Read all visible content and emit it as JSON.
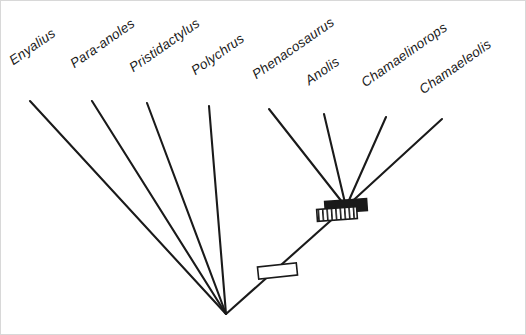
{
  "figure": {
    "type": "cladogram",
    "background_color": "#ffffff",
    "line_color": "#1a1a1a",
    "border_color": "#d8d8d8",
    "width": 526,
    "height": 335
  },
  "taxa": [
    {
      "name": "Enyalius",
      "label_x": 14,
      "label_y": 66,
      "tip_x": 29,
      "tip_y": 100
    },
    {
      "name": "Para-anoles",
      "label_x": 75,
      "label_y": 69,
      "tip_x": 91,
      "tip_y": 100
    },
    {
      "name": "Pristidactylus",
      "label_x": 134,
      "label_y": 73,
      "tip_x": 146,
      "tip_y": 102
    },
    {
      "name": "Polychrus",
      "label_x": 196,
      "label_y": 76,
      "tip_x": 208,
      "tip_y": 105
    },
    {
      "name": "Phenacosaurus",
      "label_x": 257,
      "label_y": 80,
      "tip_x": 268,
      "tip_y": 108
    },
    {
      "name": "Anolis",
      "label_x": 310,
      "label_y": 86,
      "tip_x": 323,
      "tip_y": 113
    },
    {
      "name": "Chamaelinorops",
      "label_x": 366,
      "label_y": 88,
      "tip_x": 385,
      "tip_y": 116
    },
    {
      "name": "Chamaeleolis",
      "label_x": 424,
      "label_y": 95,
      "tip_x": 441,
      "tip_y": 118
    }
  ],
  "nodes": {
    "root": {
      "name": "basal-node",
      "x": 225,
      "y": 313
    },
    "anoline_crown": {
      "name": "anoline-crown-node",
      "x": 345,
      "y": 206
    }
  },
  "branches": [
    {
      "name": "branch-enyalius",
      "from": "tip",
      "x1": 29,
      "y1": 100,
      "x2": 225,
      "y2": 313
    },
    {
      "name": "branch-para-anoles",
      "from": "tip",
      "x1": 91,
      "y1": 100,
      "x2": 225,
      "y2": 313
    },
    {
      "name": "branch-pristidactylus",
      "from": "tip",
      "x1": 146,
      "y1": 102,
      "x2": 225,
      "y2": 313
    },
    {
      "name": "branch-polychrus",
      "from": "tip",
      "x1": 208,
      "y1": 105,
      "x2": 225,
      "y2": 313
    },
    {
      "name": "branch-internode",
      "from": "root",
      "x1": 225,
      "y1": 313,
      "x2": 345,
      "y2": 206
    },
    {
      "name": "branch-phenacosaurus",
      "from": "tip",
      "x1": 268,
      "y1": 108,
      "x2": 345,
      "y2": 206
    },
    {
      "name": "branch-anolis",
      "from": "tip",
      "x1": 323,
      "y1": 113,
      "x2": 345,
      "y2": 206
    },
    {
      "name": "branch-chamaelinorops",
      "from": "tip",
      "x1": 385,
      "y1": 116,
      "x2": 345,
      "y2": 206
    },
    {
      "name": "branch-chamaeleolis",
      "from": "tip",
      "x1": 441,
      "y1": 118,
      "x2": 345,
      "y2": 206
    }
  ],
  "character_marks": [
    {
      "name": "open-bar-mark",
      "style": "open",
      "fill": "#ffffff",
      "stroke": "#1a1a1a",
      "x": 257,
      "y": 264,
      "width": 39,
      "height": 12,
      "rotation": -6
    },
    {
      "name": "solid-bar-mark",
      "style": "solid",
      "fill": "#1a1a1a",
      "stroke": "#1a1a1a",
      "x": 324,
      "y": 199,
      "width": 42,
      "height": 12,
      "rotation": -4
    },
    {
      "name": "hatched-bar-mark",
      "style": "hatched",
      "fill": "#ffffff",
      "stroke": "#1a1a1a",
      "x": 316,
      "y": 207,
      "width": 40,
      "height": 12,
      "rotation": -4,
      "stripes": 9
    }
  ]
}
